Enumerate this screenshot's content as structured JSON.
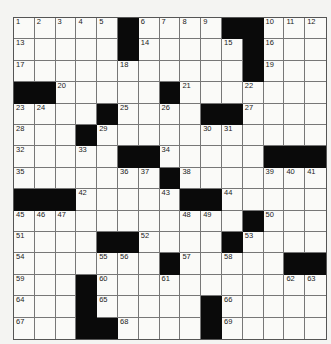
{
  "puzzle": {
    "rows": 15,
    "cols": 15,
    "colors": {
      "black": "#0a0a0a",
      "white": "#fafaf8",
      "line": "#777777"
    },
    "grid": [
      "1 2 3 4 5 # 6 7 8 9 # # 10 11 12",
      "13 . . . . # 14 . . . 15 # 16 . .",
      "17 . . . . 18 . . . . . # 19 . .",
      "# # 20 . . . . # 21 . . 22 . . .",
      "23 24 . . # 25 . 26 . # # 27 . . .",
      "28 . . # 29 . . . . 30 31 . . . .",
      "32 . . 33 . # # 34 . . . . # # #",
      "35 . . . . 36 37 # 38 . . . 39 40 41",
      "# # # 42 . . . 43 # # 44 . . . .",
      "45 46 47 . . . . . 48 49 . # 50 . .",
      "51 . . . # # 52 . . . # 53 . . .",
      "54 . . . 55 56 . # 57 . 58 . . # #",
      "59 . . # 60 . . 61 . . . . . 62 63",
      "64 . . # 65 . . . . # 66 . . . .",
      "67 . . # # 68 . . . # 69 . . . ."
    ]
  }
}
